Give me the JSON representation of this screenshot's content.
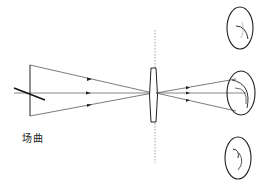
{
  "diagram": {
    "type": "optical-ray-diagram",
    "label": "场曲",
    "colors": {
      "line": "#333333",
      "lens": "#222222",
      "dashed_axis": "#888888",
      "background": "#ffffff"
    },
    "elements": [
      "object-arrow",
      "tilted-object-line",
      "optical-axis",
      "upper-ray",
      "lower-ray",
      "lens",
      "lens-plane-dashed-line",
      "image-ellipse-top",
      "image-ellipse-middle",
      "image-ellipse-bottom"
    ]
  }
}
